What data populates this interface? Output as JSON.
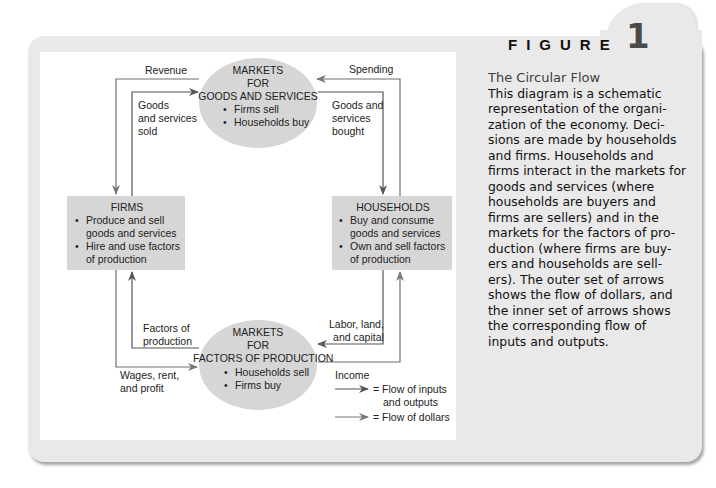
{
  "figure": {
    "label": "FIGURE",
    "number": "1"
  },
  "caption": {
    "title": "The Circular Flow",
    "body": "This diagram is a schematic representation of the organi-zation of the economy. Deci-sions are made by households and firms. Households and firms interact in the markets for goods and services (where households are buyers and firms are sellers) and in the markets for the factors of pro-duction (where firms are buy-ers and households are sell-ers). The outer set of arrows shows the flow of dollars, and the inner set of arrows shows the corresponding flow of inputs and outputs."
  },
  "nodes": {
    "goods_market": {
      "title_lines": [
        "MARKETS",
        "FOR",
        "GOODS AND SERVICES"
      ],
      "bullets": [
        "Firms sell",
        "Households buy"
      ]
    },
    "factor_market": {
      "title_lines": [
        "MARKETS",
        "FOR",
        "FACTORS OF PRODUCTION"
      ],
      "bullets": [
        "Households sell",
        "Firms buy"
      ]
    },
    "firms": {
      "title": "FIRMS",
      "bullets": [
        "Produce and sell goods and services",
        "Hire and use factors of production"
      ]
    },
    "households": {
      "title": "HOUSEHOLDS",
      "bullets": [
        "Buy and consume goods and services",
        "Own and sell factors of production"
      ]
    }
  },
  "flows": {
    "revenue": "Revenue",
    "spending": "Spending",
    "goods_sold": [
      "Goods",
      "and services",
      "sold"
    ],
    "goods_bought": [
      "Goods and",
      "services",
      "bought"
    ],
    "factors_of_production": [
      "Factors of",
      "production"
    ],
    "labor_land_capital": [
      "Labor, land,",
      "and capital"
    ],
    "wages_rent_profit": [
      "Wages, rent,",
      "and profit"
    ],
    "income": "Income"
  },
  "legend": {
    "items": [
      {
        "lines": [
          "= Flow of inputs",
          "and outputs"
        ],
        "arrow_color": "#555555"
      },
      {
        "lines": [
          "= Flow of dollars"
        ],
        "arrow_color": "#8a8a8a"
      }
    ]
  },
  "colors": {
    "panel_bg": "#e9e9e9",
    "node_fill": "#d6d6d6",
    "inner_arrow": "#555555",
    "outer_arrow": "#6e6e6e"
  }
}
